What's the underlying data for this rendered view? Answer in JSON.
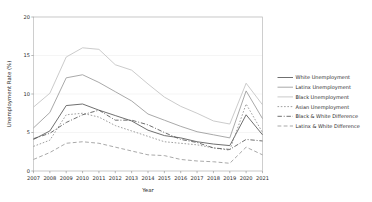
{
  "chart_data": {
    "type": "line",
    "title": "",
    "xlabel": "Year",
    "ylabel": "Unemployment Rate (%)",
    "x": [
      2007,
      2008,
      2009,
      2010,
      2011,
      2012,
      2013,
      2014,
      2015,
      2016,
      2017,
      2018,
      2019,
      2020,
      2021
    ],
    "xtick_labels": [
      "2007",
      "2008",
      "2009",
      "2010",
      "2011",
      "2012",
      "2013",
      "2014",
      "2015",
      "2016",
      "2017",
      "2018",
      "2019",
      "2020",
      "2021"
    ],
    "ytick_labels": [
      "0",
      "5",
      "10",
      "15",
      "20"
    ],
    "ytick_values": [
      0,
      5,
      10,
      15,
      20
    ],
    "xlim": [
      2007,
      2021
    ],
    "ylim": [
      0,
      20
    ],
    "grid": true,
    "legend_position": "right",
    "series": [
      {
        "name": "White Unemployment",
        "linestyle": "solid",
        "color": "#555555",
        "values": [
          4.1,
          5.2,
          8.5,
          8.7,
          7.9,
          7.2,
          6.5,
          5.3,
          4.6,
          4.3,
          3.8,
          3.5,
          3.3,
          7.3,
          4.7
        ]
      },
      {
        "name": "Latinx Unemployment",
        "linestyle": "solid",
        "color": "#9a9a9a",
        "values": [
          5.6,
          7.6,
          12.1,
          12.5,
          11.5,
          10.3,
          9.1,
          7.4,
          6.6,
          5.8,
          5.1,
          4.7,
          4.3,
          10.4,
          6.8
        ]
      },
      {
        "name": "Black Unemployment",
        "linestyle": "solid",
        "color": "#c2c2c2",
        "values": [
          8.3,
          10.1,
          14.8,
          16.0,
          15.8,
          13.8,
          13.1,
          11.3,
          9.6,
          8.4,
          7.5,
          6.5,
          6.1,
          11.4,
          8.6
        ]
      },
      {
        "name": "Asian Unemployment",
        "linestyle": "dotted",
        "color": "#8f8f8f",
        "values": [
          3.2,
          4.0,
          7.3,
          7.5,
          7.0,
          5.9,
          5.2,
          4.5,
          3.8,
          3.6,
          3.4,
          3.0,
          2.7,
          8.7,
          5.0
        ]
      },
      {
        "name": "Black & White Difference",
        "linestyle": "dashdot",
        "color": "#555555",
        "values": [
          4.2,
          4.9,
          6.3,
          7.3,
          7.9,
          6.6,
          6.6,
          6.0,
          5.0,
          4.1,
          3.7,
          3.0,
          2.8,
          4.1,
          3.9
        ]
      },
      {
        "name": "Latinx & White Difference",
        "linestyle": "dashed",
        "color": "#9a9a9a",
        "values": [
          1.5,
          2.4,
          3.6,
          3.8,
          3.6,
          3.1,
          2.6,
          2.1,
          2.0,
          1.5,
          1.3,
          1.2,
          1.0,
          3.1,
          2.1
        ]
      }
    ]
  }
}
